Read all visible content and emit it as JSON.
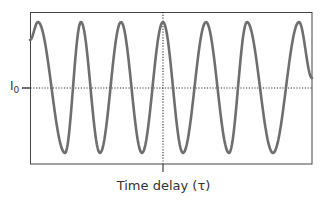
{
  "figure": {
    "y_reference_label": "I",
    "y_reference_subscript": "0",
    "x_axis_label": "Time delay (τ)",
    "colors": {
      "frame": "#444444",
      "wave": "#6e6e6e",
      "reference_lines": "#333333"
    }
  },
  "chart_data": {
    "type": "line",
    "title": "",
    "xlabel": "Time delay (τ)",
    "ylabel": "",
    "y_reference": {
      "label": "I0",
      "style": "dotted horizontal"
    },
    "x_reference": {
      "label": "τ = 0",
      "style": "dotted vertical at center"
    },
    "extrema_px": [
      {
        "x": 30,
        "y": 40
      },
      {
        "x": 38,
        "y": 22
      },
      {
        "x": 65,
        "y": 153
      },
      {
        "x": 81,
        "y": 22
      },
      {
        "x": 100,
        "y": 153
      },
      {
        "x": 121,
        "y": 22
      },
      {
        "x": 142,
        "y": 153
      },
      {
        "x": 163,
        "y": 22
      },
      {
        "x": 183,
        "y": 153
      },
      {
        "x": 206,
        "y": 22
      },
      {
        "x": 229,
        "y": 153
      },
      {
        "x": 247,
        "y": 22
      },
      {
        "x": 273,
        "y": 153
      },
      {
        "x": 299,
        "y": 22
      },
      {
        "x": 312,
        "y": 78
      }
    ],
    "frame_px": {
      "left": 30,
      "top": 12,
      "right": 312,
      "bottom": 164
    },
    "baseline_y_px": 88,
    "center_x_px": 163
  }
}
